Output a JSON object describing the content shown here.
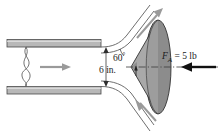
{
  "figure": {
    "labels": {
      "angle": "60",
      "degree_symbol": "°",
      "diameter": "6 in.",
      "force_symbol": "F",
      "force_subscript": "A",
      "force_value": " = 5 lb"
    },
    "colors": {
      "pipe_wall_fill": "#b8b8b8",
      "pipe_wall_stroke": "#4a4a4a",
      "cone_body_fill": "#a9a9a9",
      "cone_base_fill": "#8c8c8c",
      "flow_arrow": "#9a9a9a",
      "force_arrow": "#111111",
      "outline": "#3c3c3c",
      "background": "#ffffff"
    },
    "elements": {
      "pipe": "horizontal-pipe-with-break-symbol",
      "flow_arrow": "rightward-flow-arrow",
      "break_symbol": "pipe-break-squiggle",
      "dimension_line": "vertical-6-inch-dimension",
      "jet_upper": "upper-deflected-stream",
      "jet_lower": "lower-deflected-stream",
      "cone": "conical-deflector",
      "centerline": "dash-dot-axis",
      "force_arrow": "leftward-applied-force-arrow"
    }
  }
}
